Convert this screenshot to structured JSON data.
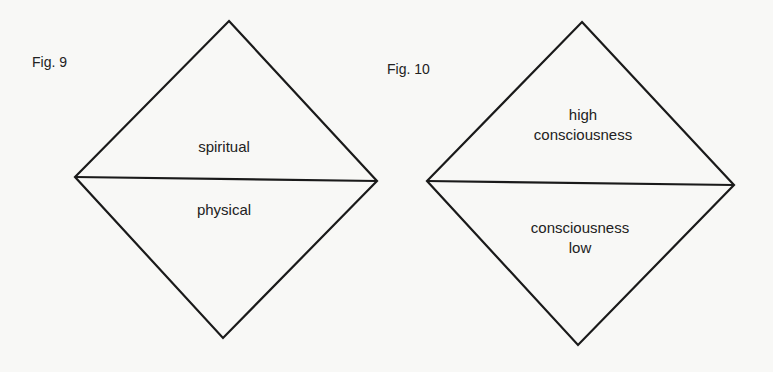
{
  "figures": [
    {
      "caption": "Fig. 9",
      "upper_label": "spiritual",
      "lower_label": "physical",
      "shape": "diamond-split-horizontal"
    },
    {
      "caption": "Fig. 10",
      "upper_label_line1": "high",
      "upper_label_line2": "consciousness",
      "lower_label_line1": "consciousness",
      "lower_label_line2": "low",
      "shape": "diamond-split-horizontal"
    }
  ],
  "colors": {
    "background": "#f8f8f6",
    "stroke": "#1a1a1a",
    "text": "#222222"
  }
}
